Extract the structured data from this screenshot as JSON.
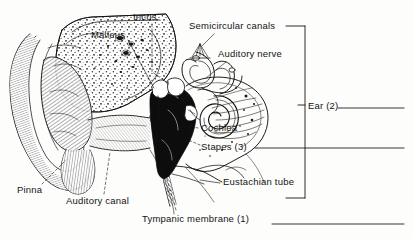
{
  "figure": {
    "style": "black-and-white engraved anatomical illustration",
    "ink_color": "#141414",
    "background_color": "#fdfdfc"
  },
  "labels": {
    "incus": "Incus",
    "malleus": "Malleus",
    "semicircular_canals": "Semicircular canals",
    "auditory_nerve": "Auditory nerve",
    "cochlea": "Cochlea",
    "stapes": "Stapes (3)",
    "eustachian_tube": "Eustachian tube",
    "tympanic_membrane": "Tympanic membrane (1)",
    "pinna": "Pinna",
    "auditory_canal": "Auditory canal",
    "ear_bracket": "Ear (2)"
  },
  "answer_blanks": [
    {
      "for": "Ear (2)",
      "number": 2
    },
    {
      "for": "Stapes (3)",
      "number": 3
    },
    {
      "for": "Tympanic membrane (1)",
      "number": 1
    }
  ]
}
